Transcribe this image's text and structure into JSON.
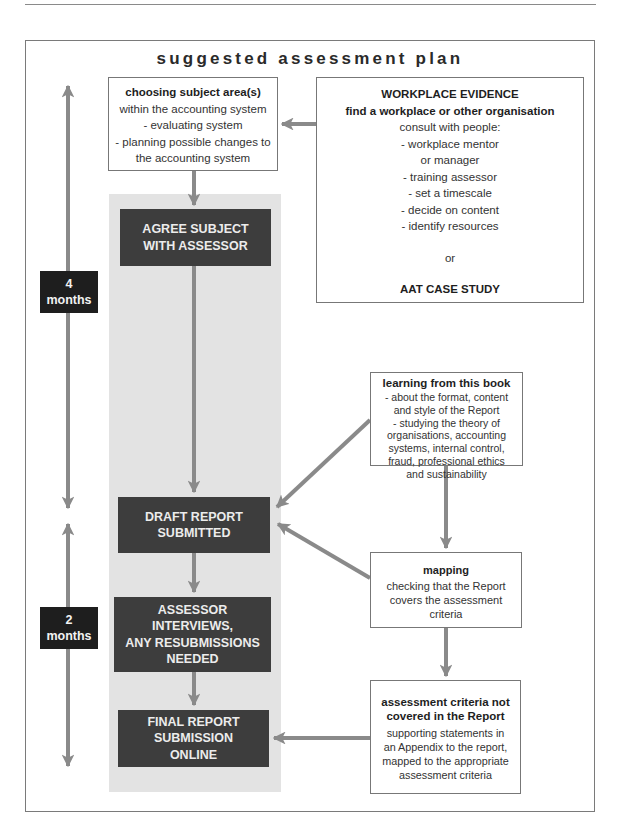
{
  "title": "suggested assessment plan",
  "timeline": {
    "phase1": {
      "value": "4",
      "unit": "months"
    },
    "phase2": {
      "value": "2",
      "unit": "months"
    }
  },
  "choosing": {
    "heading": "choosing subject area(s)",
    "lines": [
      "within the accounting system",
      "- evaluating system",
      "- planning possible changes to",
      "the accounting system"
    ]
  },
  "workplace": {
    "heading": "WORKPLACE EVIDENCE",
    "subheading": "find a workplace or other organisation",
    "lines": [
      "consult with people:",
      "- workplace mentor",
      "or manager",
      "- training assessor",
      "- set a timescale",
      "- decide on content",
      "- identify resources"
    ],
    "or": "or",
    "alternative": "AAT CASE STUDY"
  },
  "steps": [
    {
      "lines": [
        "AGREE SUBJECT",
        "WITH ASSESSOR"
      ]
    },
    {
      "lines": [
        "DRAFT REPORT",
        "SUBMITTED"
      ]
    },
    {
      "lines": [
        "ASSESSOR",
        "INTERVIEWS,",
        "ANY RESUBMISSIONS",
        "NEEDED"
      ]
    },
    {
      "lines": [
        "FINAL REPORT",
        "SUBMISSION",
        "ONLINE"
      ]
    }
  ],
  "learning": {
    "heading": "learning from this book",
    "lines": [
      "- about the format, content",
      "and style of the Report",
      "- studying the theory of",
      "organisations, accounting",
      "systems, internal control,",
      "fraud, professional ethics",
      "and sustainability"
    ]
  },
  "mapping": {
    "heading": "mapping",
    "lines": [
      "checking that the Report",
      "covers the assessment",
      "criteria"
    ]
  },
  "criteria": {
    "heading_lines": [
      "assessment criteria not",
      "covered in the Report"
    ],
    "lines": [
      "supporting statements in",
      "an Appendix to the report,",
      "mapped to the appropriate",
      "assessment criteria"
    ]
  },
  "colors": {
    "arrow": "#8a8a8a",
    "dark_box": "#3d3d3d",
    "time_box": "#1e1e1e",
    "column_bg": "#e3e3e3"
  }
}
